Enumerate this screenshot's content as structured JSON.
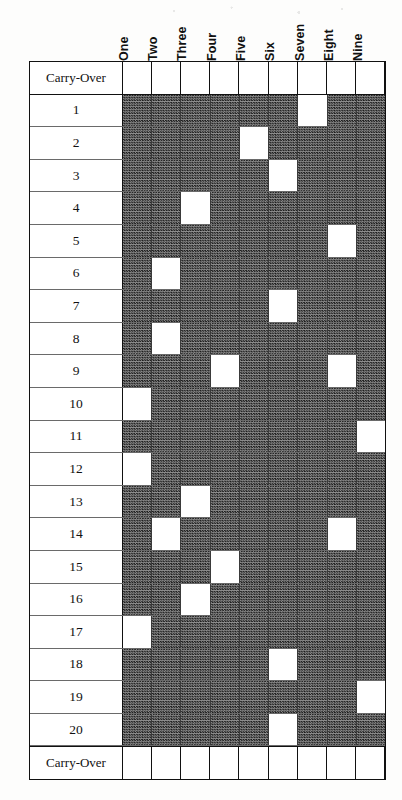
{
  "table": {
    "column_headers": [
      "One",
      "Two",
      "Three",
      "Four",
      "Five",
      "Six",
      "Seven",
      "Eight",
      "Nine"
    ],
    "row_label_header": "",
    "carry_over_label": "Carry-Over",
    "rows": [
      {
        "label": "Carry-Over",
        "type": "carry-over",
        "open_columns": [
          1,
          2,
          3,
          4,
          5,
          6,
          7,
          8,
          9
        ]
      },
      {
        "label": "1",
        "type": "data",
        "open_columns": [
          7
        ]
      },
      {
        "label": "2",
        "type": "data",
        "open_columns": [
          5
        ]
      },
      {
        "label": "3",
        "type": "data",
        "open_columns": [
          6
        ]
      },
      {
        "label": "4",
        "type": "data",
        "open_columns": [
          3
        ]
      },
      {
        "label": "5",
        "type": "data",
        "open_columns": [
          8
        ]
      },
      {
        "label": "6",
        "type": "data",
        "open_columns": [
          2
        ]
      },
      {
        "label": "7",
        "type": "data",
        "open_columns": [
          6
        ]
      },
      {
        "label": "8",
        "type": "data",
        "open_columns": [
          2
        ]
      },
      {
        "label": "9",
        "type": "data",
        "open_columns": [
          4,
          8
        ]
      },
      {
        "label": "10",
        "type": "data",
        "open_columns": [
          1
        ]
      },
      {
        "label": "11",
        "type": "data",
        "open_columns": [
          9
        ]
      },
      {
        "label": "12",
        "type": "data",
        "open_columns": [
          1
        ]
      },
      {
        "label": "13",
        "type": "data",
        "open_columns": [
          3
        ]
      },
      {
        "label": "14",
        "type": "data",
        "open_columns": [
          2,
          8
        ]
      },
      {
        "label": "15",
        "type": "data",
        "open_columns": [
          4
        ]
      },
      {
        "label": "16",
        "type": "data",
        "open_columns": [
          3
        ]
      },
      {
        "label": "17",
        "type": "data",
        "open_columns": [
          1
        ]
      },
      {
        "label": "18",
        "type": "data",
        "open_columns": [
          6
        ]
      },
      {
        "label": "19",
        "type": "data",
        "open_columns": [
          9
        ]
      },
      {
        "label": "20",
        "type": "data",
        "open_columns": [
          6
        ]
      },
      {
        "label": "Carry-Over",
        "type": "carry-over",
        "open_columns": [
          1,
          2,
          3,
          4,
          5,
          6,
          7,
          8,
          9
        ]
      }
    ]
  },
  "style": {
    "shaded_fill": "#4a4a4a",
    "open_fill": "#ffffff",
    "border_color": "#111111",
    "inner_rule_color": "#3a3a3a"
  }
}
